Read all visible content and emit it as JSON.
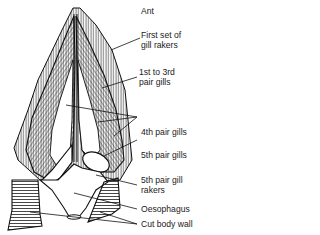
{
  "diagram": {
    "orientation_label": "Ant",
    "labels": [
      {
        "id": "first-gill-rakers",
        "lines": [
          "First set of",
          "gill rakers"
        ]
      },
      {
        "id": "gills-1-3",
        "lines": [
          "1st to 3rd",
          "pair gills"
        ]
      },
      {
        "id": "gills-4",
        "lines": [
          "4th pair gills"
        ]
      },
      {
        "id": "gills-5",
        "lines": [
          "5th pair gills"
        ]
      },
      {
        "id": "gill-rakers-5",
        "lines": [
          "5th pair gill",
          "rakers"
        ]
      },
      {
        "id": "oesophagus",
        "lines": [
          "Oesophagus"
        ]
      },
      {
        "id": "cut-body-wall",
        "lines": [
          "Cut body wall"
        ]
      }
    ]
  }
}
